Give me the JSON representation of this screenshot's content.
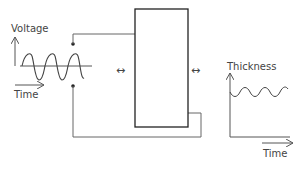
{
  "input_graph": {
    "y_label": "Voltage",
    "x_label": "Time",
    "signal": "sine",
    "periods": 3
  },
  "device": {
    "shape": "rectangle",
    "left_arrow": "↔",
    "right_arrow": "↔"
  },
  "output_graph": {
    "y_label": "Thickness",
    "x_label": "Time",
    "signal": "small sine oscillation",
    "periods": 3
  },
  "colors": {
    "line": "#555555",
    "box": "#222222",
    "text": "#444444"
  }
}
